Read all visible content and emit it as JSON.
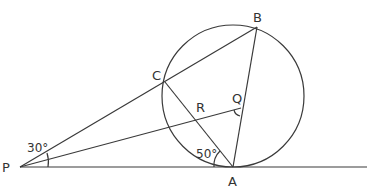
{
  "diagram": {
    "points": {
      "P": {
        "label": "P",
        "x": 20,
        "y": 167
      },
      "A": {
        "label": "A",
        "x": 233,
        "y": 167
      },
      "B": {
        "label": "B",
        "x": 257,
        "y": 27
      },
      "C": {
        "label": "C",
        "x": 165,
        "y": 82
      },
      "Q": {
        "label": "Q",
        "x": 241,
        "y": 108
      },
      "R": {
        "label": "R",
        "x": 195,
        "y": 118
      }
    },
    "circle": {
      "cx": 233,
      "cy": 96,
      "r": 71
    },
    "angles": {
      "at_P": "30°",
      "at_A": "50°"
    },
    "labels": {
      "P": "P",
      "A": "A",
      "B": "B",
      "C": "C",
      "Q": "Q",
      "R": "R"
    }
  }
}
